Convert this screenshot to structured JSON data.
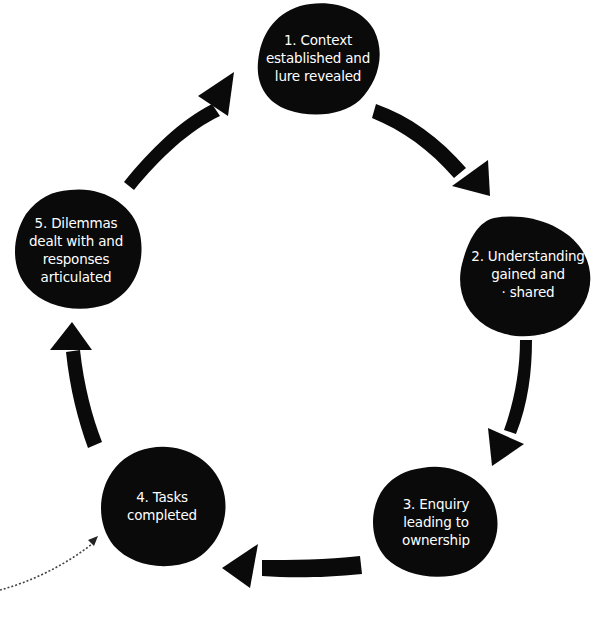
{
  "diagram": {
    "type": "cycle",
    "background": "#ffffff",
    "node_color": "#0a0a0a",
    "text_color": "#ffffff",
    "arrow_color": "#0a0a0a",
    "nodes": [
      {
        "id": 1,
        "lines": [
          "1. Context",
          "established and",
          "lure revealed"
        ]
      },
      {
        "id": 2,
        "lines": [
          "2. Understanding",
          "gained and",
          "· shared"
        ]
      },
      {
        "id": 3,
        "lines": [
          "3. Enquiry",
          "leading to",
          "ownership"
        ]
      },
      {
        "id": 4,
        "lines": [
          "4. Tasks",
          "completed"
        ]
      },
      {
        "id": 5,
        "lines": [
          "5. Dilemmas",
          "dealt with and",
          "responses",
          "articulated"
        ]
      }
    ],
    "edges": [
      {
        "from": 1,
        "to": 2,
        "style": "bold-arrow"
      },
      {
        "from": 2,
        "to": 3,
        "style": "bold-arrow"
      },
      {
        "from": 3,
        "to": 4,
        "style": "bold-arrow"
      },
      {
        "from": 4,
        "to": 5,
        "style": "bold-arrow"
      },
      {
        "from": 5,
        "to": 1,
        "style": "bold-arrow"
      }
    ],
    "annotations": [
      {
        "type": "dotted-arrow",
        "points_to": 4
      }
    ]
  }
}
